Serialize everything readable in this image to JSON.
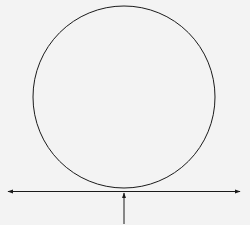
{
  "diagram": {
    "title": "",
    "elements": {
      "circle": {
        "label": ""
      },
      "tangent_line": {
        "label": "",
        "style": "double-headed arrow"
      },
      "pointer_arrow": {
        "label": "",
        "direction": "up",
        "target": "point of tangency"
      }
    },
    "colors": {
      "stroke": "#1a1a1a",
      "background": "#f3f3f3"
    }
  }
}
